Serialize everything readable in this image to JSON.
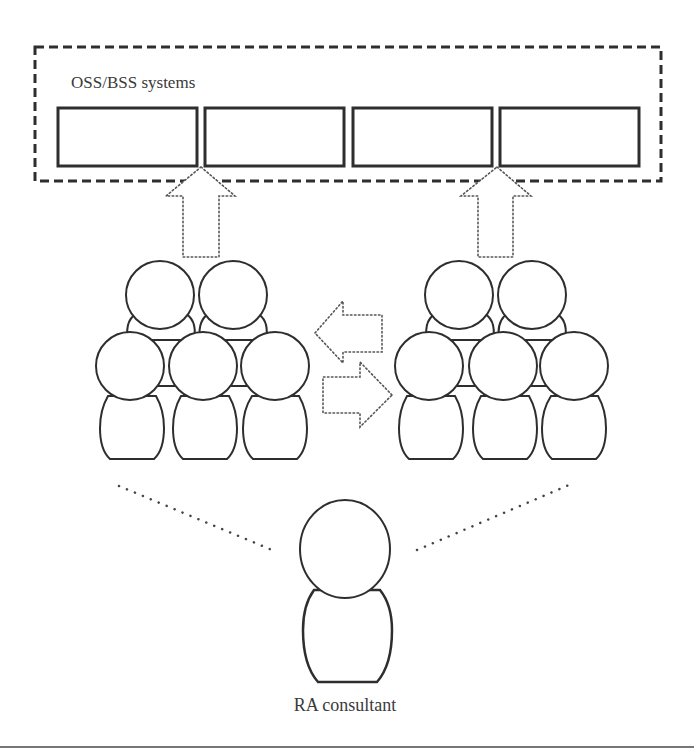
{
  "diagram": {
    "systems_group": {
      "label": "OSS/BSS systems",
      "box_count": 4
    },
    "teams": [
      {
        "name": "left-team",
        "members": 5
      },
      {
        "name": "right-team",
        "members": 5
      }
    ],
    "consultant": {
      "label": "RA consultant"
    },
    "arrows": [
      {
        "from": "left-team",
        "to": "OSS/BSS systems",
        "style": "dotted"
      },
      {
        "from": "right-team",
        "to": "OSS/BSS systems",
        "style": "dotted"
      },
      {
        "from": "right-team",
        "to": "left-team",
        "style": "dotted"
      },
      {
        "from": "left-team",
        "to": "right-team",
        "style": "dotted"
      }
    ],
    "colors": {
      "stroke": "#2e2e2e",
      "dotted": "#555555",
      "background": "#ffffff"
    }
  }
}
